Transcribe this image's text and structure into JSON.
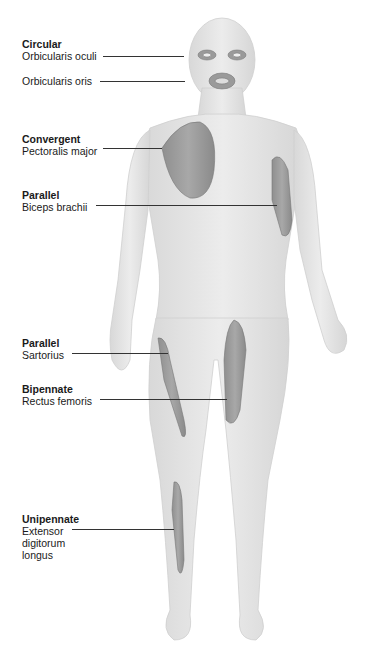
{
  "diagram": {
    "labels": [
      {
        "type": "Circular",
        "muscle": "Orbicularis oculi",
        "top": 38,
        "line_y": 56,
        "line_x1": 103,
        "line_x2": 184
      },
      {
        "type": "",
        "muscle": "Orbicularis oris",
        "top": 75,
        "line_y": 81,
        "line_x1": 100,
        "line_x2": 185
      },
      {
        "type": "Convergent",
        "muscle": "Pectoralis major",
        "top": 133,
        "line_y": 148,
        "line_x1": 103,
        "line_x2": 162
      },
      {
        "type": "Parallel",
        "muscle": "Biceps brachii",
        "top": 189,
        "line_y": 205,
        "line_x1": 96,
        "line_x2": 277
      },
      {
        "type": "Parallel",
        "muscle": "Sartorius",
        "top": 337,
        "line_y": 353,
        "line_x1": 72,
        "line_x2": 168
      },
      {
        "type": "Bipennate",
        "muscle": "Rectus femoris",
        "top": 383,
        "line_y": 399,
        "line_x1": 100,
        "line_x2": 227
      },
      {
        "type": "Unipennate",
        "muscle": "Extensor",
        "muscle2": "digitorum",
        "muscle3": "longus",
        "top": 513,
        "line_y": 529,
        "line_x1": 72,
        "line_x2": 174
      }
    ]
  }
}
